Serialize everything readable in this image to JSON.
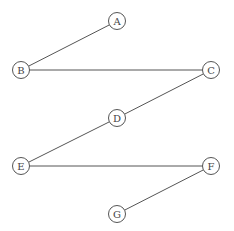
{
  "diagram": {
    "type": "graph",
    "nodes": [
      {
        "id": "A",
        "label": "A",
        "x": 117,
        "y": 21
      },
      {
        "id": "B",
        "label": "B",
        "x": 21,
        "y": 70
      },
      {
        "id": "C",
        "label": "C",
        "x": 211,
        "y": 70
      },
      {
        "id": "D",
        "label": "D",
        "x": 117,
        "y": 118
      },
      {
        "id": "E",
        "label": "E",
        "x": 21,
        "y": 166
      },
      {
        "id": "F",
        "label": "F",
        "x": 211,
        "y": 166
      },
      {
        "id": "G",
        "label": "G",
        "x": 117,
        "y": 214
      }
    ],
    "edges": [
      {
        "from": "A",
        "to": "B"
      },
      {
        "from": "B",
        "to": "C"
      },
      {
        "from": "C",
        "to": "D"
      },
      {
        "from": "D",
        "to": "E"
      },
      {
        "from": "E",
        "to": "F"
      },
      {
        "from": "F",
        "to": "G"
      }
    ]
  }
}
